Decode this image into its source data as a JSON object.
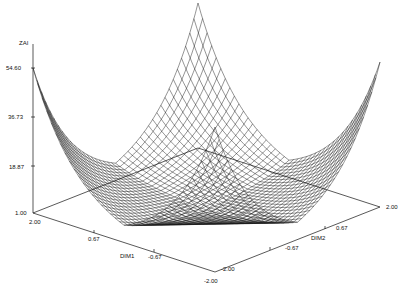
{
  "chart_data": {
    "type": "surface",
    "title": "",
    "function": "ZAI = exp(|DIM1| + |DIM2|)",
    "xlabel": "DIM1",
    "ylabel": "DIM2",
    "zlabel": "ZAI",
    "x_range": [
      -2.0,
      2.0
    ],
    "y_range": [
      -2.0,
      2.0
    ],
    "z_range": [
      1.0,
      54.6
    ],
    "x_ticks": [
      "2.00",
      "0.67",
      "-0.67",
      "-2.00"
    ],
    "y_ticks": [
      "-2.00",
      "-0.67",
      "0.67",
      "2.00"
    ],
    "z_ticks": [
      "1.00",
      "18.87",
      "36.73",
      "54.60"
    ],
    "grid_lines_per_axis": 41,
    "corner_values": {
      "DIM1=2,DIM2=2": 54.6,
      "DIM1=2,DIM2=-2": 54.6,
      "DIM1=-2,DIM2=2": 54.6,
      "DIM1=-2,DIM2=-2": 54.6
    },
    "minimum": {
      "DIM1": 0,
      "DIM2": 0,
      "ZAI": 1.0
    },
    "style": "wireframe mesh, black lines on white, no legend"
  },
  "axes": {
    "z": {
      "title": "ZAI",
      "ticks": [
        "54.60",
        "36.73",
        "18.87",
        "1.00"
      ]
    },
    "dim1": {
      "title": "DIM1",
      "ticks": [
        "2.00",
        "0.67",
        "-0.67",
        "-2.00"
      ]
    },
    "dim2": {
      "title": "DIM2",
      "ticks": [
        "-2.00",
        "-0.67",
        "0.67",
        "2.00"
      ]
    }
  },
  "colors": {
    "line": "#111111",
    "background": "#ffffff"
  }
}
